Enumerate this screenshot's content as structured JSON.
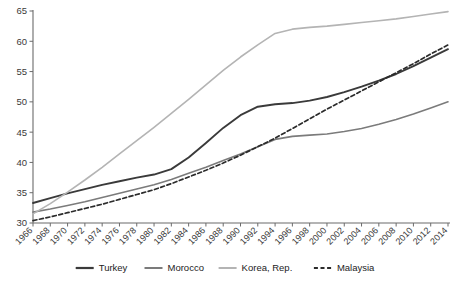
{
  "chart_data": {
    "type": "line",
    "title": "",
    "subtitle": "",
    "xlabel": "",
    "ylabel": "",
    "xlim": [
      1966,
      2014
    ],
    "ylim": [
      30,
      65
    ],
    "grid": false,
    "legend_position": "bottom",
    "y_ticks": [
      30,
      35,
      40,
      45,
      50,
      55,
      60,
      65
    ],
    "x": [
      1966,
      1968,
      1970,
      1972,
      1974,
      1976,
      1978,
      1980,
      1982,
      1984,
      1986,
      1988,
      1990,
      1992,
      1994,
      1996,
      1998,
      2000,
      2002,
      2004,
      2006,
      2008,
      2010,
      2012,
      2014
    ],
    "categories": [
      "1966",
      "1968",
      "1970",
      "1972",
      "1974",
      "1976",
      "1978",
      "1980",
      "1982",
      "1984",
      "1986",
      "1988",
      "1990",
      "1992",
      "1994",
      "1996",
      "1998",
      "2000",
      "2002",
      "2004",
      "2006",
      "2008",
      "2010",
      "2012",
      "2014"
    ],
    "series": [
      {
        "name": "Turkey",
        "color": "#3a3a3a",
        "dash": "none",
        "width": 1.9,
        "values": [
          33.3,
          34.1,
          34.9,
          35.6,
          36.3,
          36.9,
          37.5,
          38.0,
          38.9,
          40.8,
          43.2,
          45.7,
          47.8,
          49.2,
          49.6,
          49.8,
          50.2,
          50.8,
          51.6,
          52.5,
          53.5,
          54.6,
          55.9,
          57.3,
          58.7
        ]
      },
      {
        "name": "Morocco",
        "color": "#7b7b7b",
        "dash": "none",
        "width": 1.6,
        "values": [
          31.8,
          32.3,
          32.9,
          33.5,
          34.2,
          34.9,
          35.6,
          36.3,
          37.2,
          38.2,
          39.2,
          40.3,
          41.4,
          42.6,
          43.8,
          44.3,
          44.5,
          44.7,
          45.1,
          45.6,
          46.3,
          47.1,
          48.0,
          49.0,
          50.0
        ]
      },
      {
        "name": "Korea, Rep.",
        "color": "#b4b4b4",
        "dash": "none",
        "width": 1.6,
        "values": [
          31.5,
          33.2,
          35.1,
          37.1,
          39.2,
          41.4,
          43.6,
          45.8,
          48.1,
          50.4,
          52.8,
          55.2,
          57.4,
          59.4,
          61.3,
          62.0,
          62.3,
          62.5,
          62.8,
          63.1,
          63.4,
          63.7,
          64.1,
          64.5,
          64.9
        ]
      },
      {
        "name": "Malaysia",
        "color": "#2b2b2b",
        "dash": "4,2.6",
        "width": 1.7,
        "values": [
          30.4,
          31.0,
          31.7,
          32.4,
          33.1,
          33.9,
          34.7,
          35.5,
          36.5,
          37.6,
          38.7,
          39.9,
          41.2,
          42.6,
          44.0,
          45.6,
          47.2,
          48.8,
          50.3,
          51.8,
          53.3,
          54.8,
          56.3,
          57.9,
          59.4
        ]
      }
    ],
    "legend": [
      {
        "label": "Turkey",
        "color": "#3a3a3a",
        "dash": "none",
        "width": 2.2
      },
      {
        "label": "Morocco",
        "color": "#7b7b7b",
        "dash": "none",
        "width": 2.0
      },
      {
        "label": "Korea, Rep.",
        "color": "#b4b4b4",
        "dash": "none",
        "width": 2.0
      },
      {
        "label": "Malaysia",
        "color": "#2b2b2b",
        "dash": "4,2.6",
        "width": 2.0
      }
    ]
  },
  "axis": {
    "color": "#6b6b6b"
  }
}
